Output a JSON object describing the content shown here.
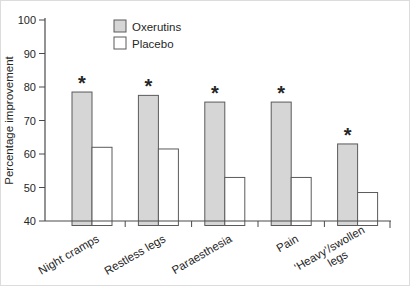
{
  "figure": {
    "background": "#ffffff",
    "border_color": "#dcdcdc",
    "axis_color": "#4a4a4a",
    "bar_outline_color": "#5a5a5a",
    "text_color": "#262626"
  },
  "chart_data": {
    "type": "bar",
    "title": "",
    "xlabel": "",
    "ylabel": "Percentage improvement",
    "ylim": [
      40,
      100
    ],
    "yticks": [
      40,
      50,
      60,
      70,
      80,
      90,
      100
    ],
    "grid": false,
    "legend_position": "top-inside-left",
    "categories": [
      "Night cramps",
      "Restless legs",
      "Paraesthesia",
      "Pain",
      "‘Heavy’/swollen\nlegs"
    ],
    "series": [
      {
        "name": "Oxerutins",
        "fill": "#d6d6d6",
        "values": [
          78.5,
          77.5,
          75.5,
          75.5,
          63
        ]
      },
      {
        "name": "Placebo",
        "fill": "#ffffff",
        "values": [
          62,
          61.5,
          53,
          53,
          48.5
        ]
      }
    ],
    "annotations": {
      "symbol": "*",
      "on_series": "Oxerutins",
      "per_category": [
        true,
        true,
        true,
        true,
        true
      ]
    }
  }
}
